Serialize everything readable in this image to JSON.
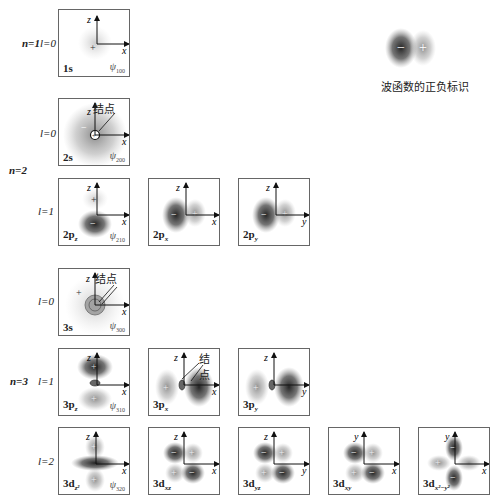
{
  "figure": {
    "legend": {
      "text": "波函数的正负标识",
      "minus": "−",
      "plus": "+"
    },
    "node_label": "结点",
    "row_labels": {
      "n1": "n=1",
      "n2": "n=2",
      "n3": "n=3",
      "l0_1": "l=0",
      "l0_2": "l=0",
      "l1_2": "l=1",
      "l0_3": "l=0",
      "l1_3": "l=1",
      "l2_3": "l=2"
    },
    "panels": {
      "p1s": {
        "name": "1s",
        "psi": "ψ",
        "psi_sub": "100",
        "h": "x",
        "v": "z"
      },
      "p2s": {
        "name": "2s",
        "psi": "ψ",
        "psi_sub": "200",
        "h": "x",
        "v": "z"
      },
      "p2pz": {
        "name": "2p",
        "sub": "z",
        "psi": "ψ",
        "psi_sub": "210",
        "h": "x",
        "v": "z"
      },
      "p2px": {
        "name": "2p",
        "sub": "x",
        "h": "x",
        "v": "z"
      },
      "p2py": {
        "name": "2p",
        "sub": "y",
        "h": "y",
        "v": "z"
      },
      "p3s": {
        "name": "3s",
        "psi": "ψ",
        "psi_sub": "300",
        "h": "x",
        "v": "z"
      },
      "p3pz": {
        "name": "3p",
        "sub": "z",
        "psi": "ψ",
        "psi_sub": "310",
        "h": "x",
        "v": "z"
      },
      "p3px": {
        "name": "3p",
        "sub": "x",
        "h": "x",
        "v": "z"
      },
      "p3py": {
        "name": "3p",
        "sub": "y",
        "h": "y",
        "v": "z"
      },
      "p3dz2": {
        "name": "3d",
        "sub": "z²",
        "psi": "ψ",
        "psi_sub": "320",
        "h": "x",
        "v": "z"
      },
      "p3dxz": {
        "name": "3d",
        "sub": "xz",
        "h": "x",
        "v": "z"
      },
      "p3dyz": {
        "name": "3d",
        "sub": "yz",
        "h": "y",
        "v": "z"
      },
      "p3dxy": {
        "name": "3d",
        "sub": "xy",
        "h": "x",
        "v": "y"
      },
      "p3dx2y2": {
        "name": "3d",
        "sub": "x²−y²",
        "h": "x",
        "v": "y"
      }
    },
    "signs": {
      "plus": "+",
      "minus": "−"
    }
  }
}
